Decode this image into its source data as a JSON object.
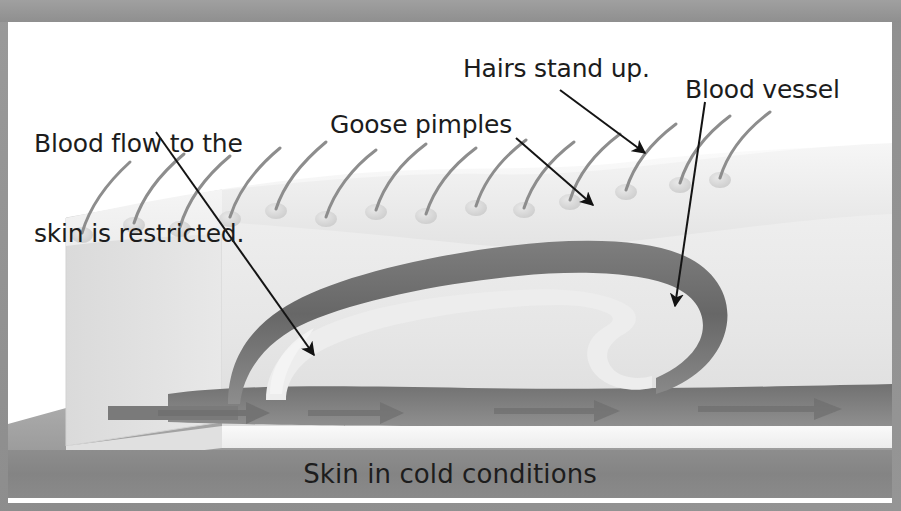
{
  "figure": {
    "kind": "labelled-biology-diagram",
    "caption": "Skin in cold conditions",
    "background_color": "#8e8e8e",
    "card_color": "#ffffff",
    "caption_band_color": "#888888",
    "text_color": "#1c1c1c"
  },
  "labels": {
    "blood_flow": "Blood flow to the\nskin is restricted.",
    "blood_flow_line1": "Blood flow to the",
    "blood_flow_line2": "skin is restricted.",
    "goose_pimples": "Goose pimples",
    "hairs_stand_up": "Hairs stand up.",
    "blood_vessel": "Blood vessel"
  },
  "leader_lines": [
    {
      "name": "blood-flow-leader",
      "label": "Blood flow to the skin is restricted.",
      "from": [
        148,
        110
      ],
      "to": [
        306,
        333
      ],
      "arrowhead": "to"
    },
    {
      "name": "goose-pimples-leader",
      "label": "Goose pimples",
      "from": [
        508,
        116
      ],
      "to": [
        585,
        183
      ],
      "arrowhead": "to"
    },
    {
      "name": "hairs-stand-up-leader",
      "label": "Hairs stand up.",
      "from": [
        552,
        68
      ],
      "to": [
        637,
        131
      ],
      "arrowhead": "to"
    },
    {
      "name": "blood-vessel-leader",
      "label": "Blood vessel",
      "from": [
        695,
        80
      ],
      "to": [
        667,
        284
      ],
      "arrowhead": "to"
    }
  ],
  "anatomy": {
    "skin_block": {
      "name": "skin-block",
      "description": "3D cut-away block of skin",
      "top_surface_color": "#f2f2f2",
      "front_face_color": "#e4e4e4",
      "left_face_color": "#dcdcdc",
      "dermis_color": "#eaeaea"
    },
    "blood_vessel": {
      "name": "blood-vessel",
      "description": "constricted looping capillary beneath the skin",
      "color": "#6f6f6f",
      "constricted": true
    },
    "hairs": {
      "name": "hair-shaft",
      "count": 14,
      "state": "standing up",
      "color": "#8a8a8a"
    },
    "goose_pimples": {
      "name": "goose-pimple",
      "description": "raised bumps at the base of each hair",
      "color": "#d9d9d9"
    },
    "flow_arrows": {
      "name": "blood-flow-arrow",
      "count": 4,
      "direction": "left-to-right",
      "color": "#737373"
    }
  }
}
